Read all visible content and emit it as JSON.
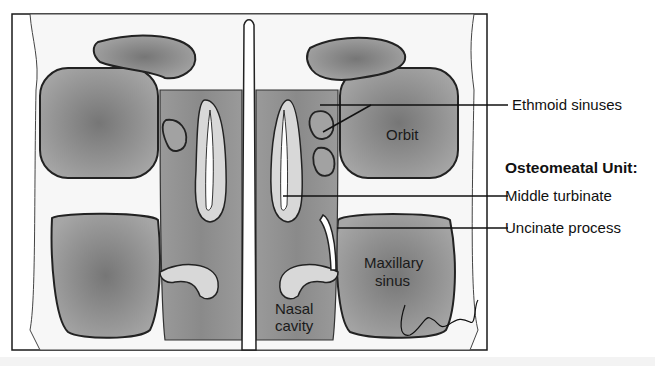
{
  "figure": {
    "colors": {
      "sinus_fill": "#8e8e8e",
      "sinus_center": "#7a7a7a",
      "bone": "#ffffff",
      "mucosa": "#d6d6d6",
      "outline": "#222222",
      "frame": "#1a1a1a"
    }
  },
  "labels": {
    "ethmoid": "Ethmoid sinuses",
    "section_heading": "Osteomeatal Unit:",
    "middle_turbinate": "Middle turbinate",
    "uncinate": "Uncinate process"
  },
  "inner_labels": {
    "orbit": "Orbit",
    "maxillary_line1": "Maxillary",
    "maxillary_line2": "sinus",
    "nasal_line1": "Nasal",
    "nasal_line2": "cavity"
  },
  "signature": "J Gregory"
}
